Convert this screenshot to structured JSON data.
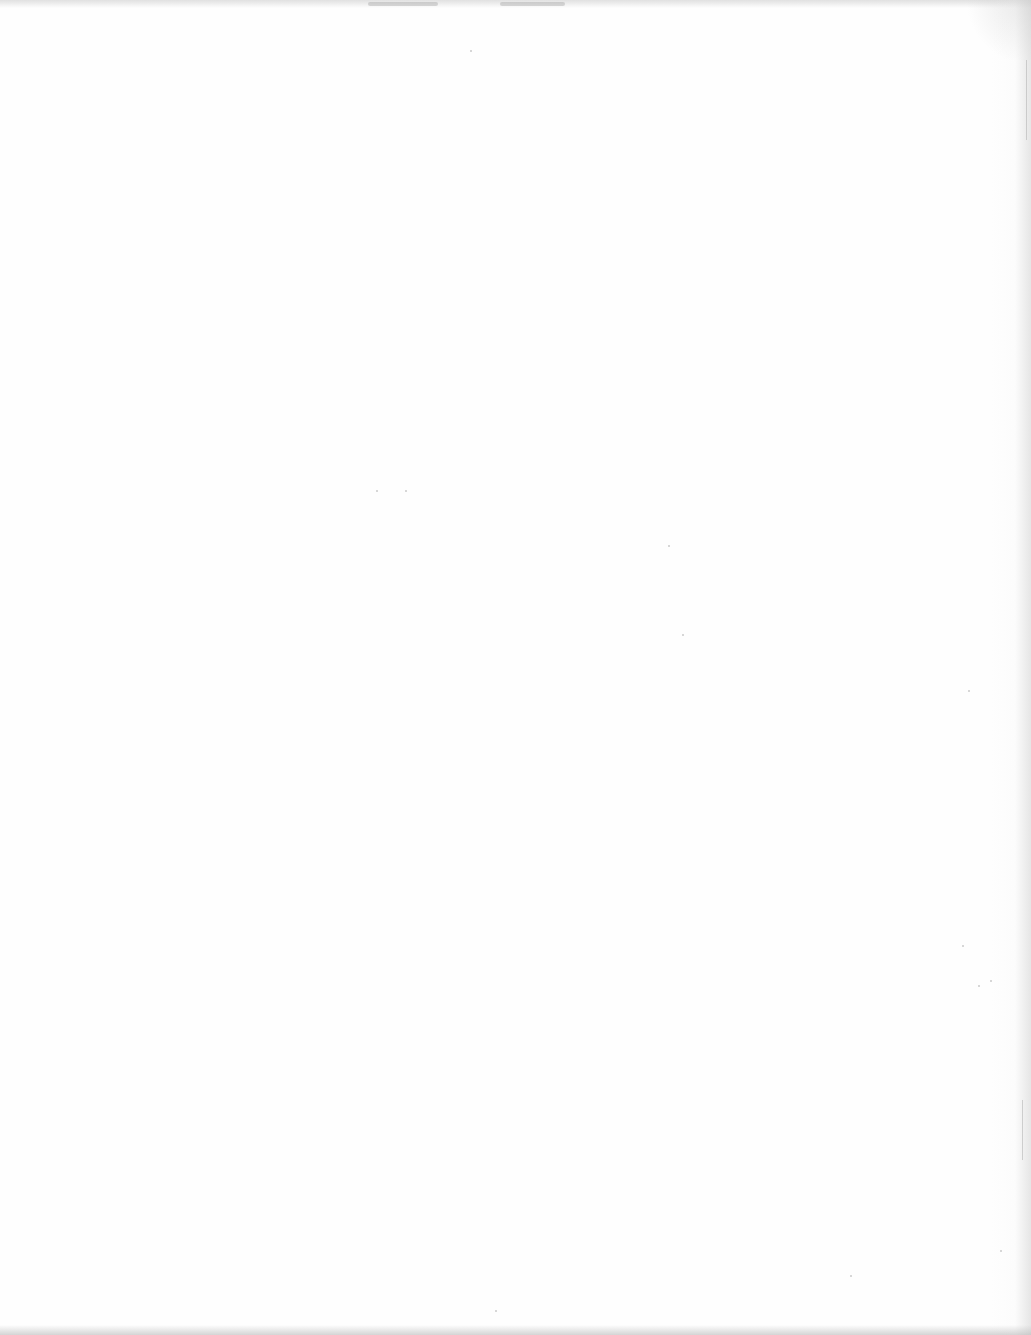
{
  "document": {
    "type": "scanned-page",
    "content_state": "blank",
    "text": ""
  },
  "colors": {
    "paper": "#fefefe",
    "edge_shadow": "#c8c8c8",
    "speck": "#8c8c8c"
  }
}
